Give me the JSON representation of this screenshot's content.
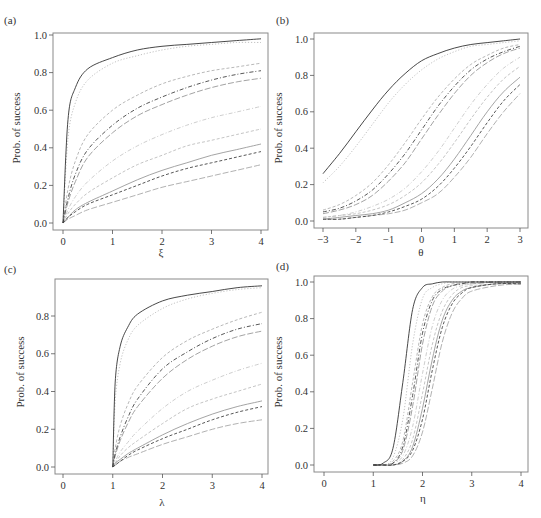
{
  "figure": {
    "panels": [
      {
        "label": "(a)",
        "xlabel": "ξ",
        "ylabel": "Prob. of success"
      },
      {
        "label": "(b)",
        "xlabel": "θ",
        "ylabel": "Prob. of success"
      },
      {
        "label": "(c)",
        "xlabel": "λ",
        "ylabel": "Prob. of success"
      },
      {
        "label": "(d)",
        "xlabel": "η",
        "ylabel": "Prob. of success"
      }
    ]
  },
  "chart_data": [
    {
      "type": "line",
      "panel": "(a)",
      "title": "",
      "xlabel": "ξ",
      "ylabel": "Prob. of success",
      "xlim": [
        0,
        4
      ],
      "ylim": [
        0.0,
        1.0
      ],
      "xticks": [
        "0",
        "1",
        "2",
        "3",
        "4"
      ],
      "yticks": [
        "0.0",
        "0.2",
        "0.4",
        "0.6",
        "0.8",
        "1.0"
      ],
      "grid": false,
      "legend": null,
      "x": [
        0,
        0.1,
        0.25,
        0.5,
        1,
        1.5,
        2,
        2.5,
        3,
        3.5,
        4
      ],
      "series": [
        {
          "name": "curve-1",
          "style": "solid",
          "color": "#333333",
          "values": [
            0,
            0.55,
            0.72,
            0.82,
            0.88,
            0.92,
            0.94,
            0.95,
            0.96,
            0.97,
            0.98
          ]
        },
        {
          "name": "curve-2",
          "style": "dotted",
          "color": "#bbbbbb",
          "values": [
            0,
            0.45,
            0.64,
            0.76,
            0.85,
            0.89,
            0.92,
            0.94,
            0.95,
            0.96,
            0.96
          ]
        },
        {
          "name": "curve-3",
          "style": "dashed",
          "color": "#b0b0b0",
          "values": [
            0,
            0.18,
            0.33,
            0.47,
            0.6,
            0.68,
            0.74,
            0.78,
            0.81,
            0.83,
            0.85
          ]
        },
        {
          "name": "curve-4",
          "style": "dashdot",
          "color": "#444444",
          "values": [
            0,
            0.13,
            0.26,
            0.39,
            0.52,
            0.61,
            0.67,
            0.72,
            0.76,
            0.79,
            0.81
          ]
        },
        {
          "name": "curve-5",
          "style": "longdash",
          "color": "#999999",
          "values": [
            0,
            0.11,
            0.22,
            0.35,
            0.48,
            0.57,
            0.63,
            0.68,
            0.72,
            0.75,
            0.77
          ]
        },
        {
          "name": "curve-6",
          "style": "dashdot",
          "color": "#c8c8c8",
          "values": [
            0,
            0.07,
            0.14,
            0.22,
            0.33,
            0.41,
            0.47,
            0.52,
            0.56,
            0.59,
            0.62
          ]
        },
        {
          "name": "curve-7",
          "style": "dashed",
          "color": "#bdbdbd",
          "values": [
            0,
            0.05,
            0.1,
            0.16,
            0.24,
            0.31,
            0.36,
            0.41,
            0.44,
            0.47,
            0.5
          ]
        },
        {
          "name": "curve-8",
          "style": "solid",
          "color": "#9a9a9a",
          "values": [
            0,
            0.03,
            0.07,
            0.11,
            0.17,
            0.23,
            0.28,
            0.32,
            0.36,
            0.39,
            0.42
          ]
        },
        {
          "name": "curve-9",
          "style": "dashed",
          "color": "#444444",
          "values": [
            0,
            0.03,
            0.06,
            0.1,
            0.15,
            0.2,
            0.25,
            0.29,
            0.32,
            0.35,
            0.38
          ]
        },
        {
          "name": "curve-10",
          "style": "longdash",
          "color": "#a8a8a8",
          "values": [
            0,
            0.02,
            0.04,
            0.07,
            0.11,
            0.15,
            0.19,
            0.22,
            0.25,
            0.28,
            0.31
          ]
        }
      ]
    },
    {
      "type": "line",
      "panel": "(b)",
      "title": "",
      "xlabel": "θ",
      "ylabel": "Prob. of success",
      "xlim": [
        -3,
        3
      ],
      "ylim": [
        0.0,
        1.0
      ],
      "xticks": [
        "−3",
        "−2",
        "−1",
        "0",
        "1",
        "2",
        "3"
      ],
      "yticks": [
        "0.0",
        "0.2",
        "0.4",
        "0.6",
        "0.8",
        "1.0"
      ],
      "grid": false,
      "legend": null,
      "x": [
        -3,
        -2.5,
        -2,
        -1.5,
        -1,
        -0.5,
        0,
        0.5,
        1,
        1.5,
        2,
        2.5,
        3
      ],
      "series": [
        {
          "name": "curve-1",
          "style": "solid",
          "color": "#333333",
          "values": [
            0.26,
            0.37,
            0.49,
            0.61,
            0.72,
            0.81,
            0.88,
            0.92,
            0.95,
            0.97,
            0.98,
            0.99,
            1.0
          ]
        },
        {
          "name": "curve-2",
          "style": "dotted",
          "color": "#bbbbbb",
          "values": [
            0.21,
            0.3,
            0.41,
            0.53,
            0.65,
            0.75,
            0.83,
            0.89,
            0.93,
            0.96,
            0.97,
            0.98,
            0.99
          ]
        },
        {
          "name": "curve-3",
          "style": "dashed",
          "color": "#b0b0b0",
          "values": [
            0.06,
            0.09,
            0.14,
            0.21,
            0.31,
            0.43,
            0.56,
            0.68,
            0.78,
            0.86,
            0.91,
            0.95,
            0.97
          ]
        },
        {
          "name": "curve-4",
          "style": "dashdot",
          "color": "#444444",
          "values": [
            0.05,
            0.07,
            0.11,
            0.17,
            0.26,
            0.37,
            0.5,
            0.63,
            0.74,
            0.83,
            0.89,
            0.93,
            0.96
          ]
        },
        {
          "name": "curve-5",
          "style": "longdash",
          "color": "#999999",
          "values": [
            0.04,
            0.06,
            0.09,
            0.14,
            0.22,
            0.32,
            0.45,
            0.58,
            0.7,
            0.8,
            0.87,
            0.92,
            0.95
          ]
        },
        {
          "name": "curve-6",
          "style": "dashdot",
          "color": "#c8c8c8",
          "values": [
            0.02,
            0.03,
            0.05,
            0.08,
            0.12,
            0.18,
            0.27,
            0.38,
            0.51,
            0.64,
            0.75,
            0.84,
            0.9
          ]
        },
        {
          "name": "curve-7",
          "style": "dashed",
          "color": "#bdbdbd",
          "values": [
            0.02,
            0.03,
            0.04,
            0.06,
            0.09,
            0.14,
            0.21,
            0.31,
            0.43,
            0.56,
            0.68,
            0.78,
            0.85
          ]
        },
        {
          "name": "curve-8",
          "style": "solid",
          "color": "#9a9a9a",
          "values": [
            0.01,
            0.02,
            0.03,
            0.04,
            0.06,
            0.1,
            0.15,
            0.23,
            0.34,
            0.47,
            0.6,
            0.71,
            0.79
          ]
        },
        {
          "name": "curve-9",
          "style": "dashed",
          "color": "#444444",
          "values": [
            0.01,
            0.01,
            0.02,
            0.03,
            0.05,
            0.08,
            0.12,
            0.19,
            0.29,
            0.41,
            0.54,
            0.66,
            0.75
          ]
        },
        {
          "name": "curve-10",
          "style": "longdash",
          "color": "#a8a8a8",
          "values": [
            0.01,
            0.01,
            0.02,
            0.03,
            0.04,
            0.06,
            0.1,
            0.15,
            0.24,
            0.35,
            0.48,
            0.6,
            0.7
          ]
        }
      ]
    },
    {
      "type": "line",
      "panel": "(c)",
      "title": "",
      "xlabel": "λ",
      "ylabel": "Prob. of success",
      "xlim": [
        0,
        4
      ],
      "ylim": [
        0.0,
        0.96
      ],
      "xticks": [
        "0",
        "1",
        "2",
        "3",
        "4"
      ],
      "yticks": [
        "0.0",
        "0.2",
        "0.4",
        "0.6",
        "0.8"
      ],
      "grid": false,
      "legend": null,
      "x": [
        1,
        1.05,
        1.15,
        1.3,
        1.5,
        2,
        2.5,
        3,
        3.5,
        4
      ],
      "series": [
        {
          "name": "curve-1",
          "style": "solid",
          "color": "#333333",
          "values": [
            0,
            0.45,
            0.64,
            0.74,
            0.81,
            0.88,
            0.91,
            0.93,
            0.95,
            0.96
          ]
        },
        {
          "name": "curve-2",
          "style": "dotted",
          "color": "#bbbbbb",
          "values": [
            0,
            0.35,
            0.55,
            0.67,
            0.75,
            0.84,
            0.89,
            0.92,
            0.94,
            0.95
          ]
        },
        {
          "name": "curve-3",
          "style": "dashed",
          "color": "#b0b0b0",
          "values": [
            0,
            0.1,
            0.22,
            0.33,
            0.43,
            0.58,
            0.67,
            0.73,
            0.78,
            0.82
          ]
        },
        {
          "name": "curve-4",
          "style": "dashdot",
          "color": "#444444",
          "values": [
            0,
            0.07,
            0.16,
            0.26,
            0.36,
            0.52,
            0.61,
            0.68,
            0.73,
            0.76
          ]
        },
        {
          "name": "curve-5",
          "style": "longdash",
          "color": "#999999",
          "values": [
            0,
            0.06,
            0.14,
            0.23,
            0.32,
            0.47,
            0.57,
            0.64,
            0.69,
            0.72
          ]
        },
        {
          "name": "curve-6",
          "style": "dashdot",
          "color": "#c8c8c8",
          "values": [
            0,
            0.03,
            0.08,
            0.13,
            0.19,
            0.31,
            0.4,
            0.46,
            0.51,
            0.55
          ]
        },
        {
          "name": "curve-7",
          "style": "dashed",
          "color": "#bdbdbd",
          "values": [
            0,
            0.02,
            0.06,
            0.1,
            0.14,
            0.23,
            0.31,
            0.36,
            0.4,
            0.44
          ]
        },
        {
          "name": "curve-8",
          "style": "solid",
          "color": "#9a9a9a",
          "values": [
            0,
            0.02,
            0.04,
            0.07,
            0.1,
            0.17,
            0.23,
            0.28,
            0.32,
            0.35
          ]
        },
        {
          "name": "curve-9",
          "style": "dashed",
          "color": "#444444",
          "values": [
            0,
            0.01,
            0.03,
            0.06,
            0.09,
            0.15,
            0.2,
            0.25,
            0.29,
            0.32
          ]
        },
        {
          "name": "curve-10",
          "style": "longdash",
          "color": "#a8a8a8",
          "values": [
            0,
            0.01,
            0.03,
            0.05,
            0.07,
            0.12,
            0.16,
            0.2,
            0.23,
            0.25
          ]
        }
      ]
    },
    {
      "type": "line",
      "panel": "(d)",
      "title": "",
      "xlabel": "η",
      "ylabel": "Prob. of success",
      "xlim": [
        0,
        4
      ],
      "ylim": [
        0.0,
        1.0
      ],
      "xticks": [
        "0",
        "1",
        "2",
        "3",
        "4"
      ],
      "yticks": [
        "0.0",
        "0.2",
        "0.4",
        "0.6",
        "0.8",
        "1.0"
      ],
      "grid": false,
      "legend": null,
      "x": [
        1.0,
        1.2,
        1.4,
        1.6,
        1.8,
        2.0,
        2.2,
        2.4,
        2.6,
        2.8,
        3.0,
        3.5,
        4.0
      ],
      "series": [
        {
          "name": "curve-1",
          "style": "solid",
          "color": "#333333",
          "values": [
            0.0,
            0.01,
            0.09,
            0.45,
            0.85,
            0.97,
            0.99,
            1.0,
            1.0,
            1.0,
            1.0,
            1.0,
            1.0
          ]
        },
        {
          "name": "curve-2",
          "style": "dotted",
          "color": "#bbbbbb",
          "values": [
            0.0,
            0.0,
            0.04,
            0.25,
            0.66,
            0.91,
            0.97,
            0.99,
            1.0,
            1.0,
            1.0,
            1.0,
            1.0
          ]
        },
        {
          "name": "curve-3",
          "style": "dashed",
          "color": "#b0b0b0",
          "values": [
            0.0,
            0.0,
            0.02,
            0.13,
            0.45,
            0.77,
            0.92,
            0.97,
            0.99,
            0.99,
            1.0,
            1.0,
            1.0
          ]
        },
        {
          "name": "curve-4",
          "style": "dashdot",
          "color": "#444444",
          "values": [
            0.0,
            0.0,
            0.01,
            0.1,
            0.38,
            0.72,
            0.9,
            0.96,
            0.98,
            0.99,
            1.0,
            1.0,
            1.0
          ]
        },
        {
          "name": "curve-5",
          "style": "longdash",
          "color": "#999999",
          "values": [
            0.0,
            0.0,
            0.01,
            0.08,
            0.32,
            0.66,
            0.87,
            0.95,
            0.98,
            0.99,
            0.99,
            1.0,
            1.0
          ]
        },
        {
          "name": "curve-6",
          "style": "dashdot",
          "color": "#c8c8c8",
          "values": [
            0.0,
            0.0,
            0.01,
            0.05,
            0.21,
            0.5,
            0.76,
            0.9,
            0.96,
            0.98,
            0.99,
            1.0,
            1.0
          ]
        },
        {
          "name": "curve-7",
          "style": "dashed",
          "color": "#bdbdbd",
          "values": [
            0.0,
            0.0,
            0.0,
            0.03,
            0.14,
            0.39,
            0.66,
            0.84,
            0.93,
            0.97,
            0.98,
            0.99,
            1.0
          ]
        },
        {
          "name": "curve-8",
          "style": "solid",
          "color": "#9a9a9a",
          "values": [
            0.0,
            0.0,
            0.0,
            0.02,
            0.1,
            0.31,
            0.58,
            0.79,
            0.9,
            0.95,
            0.97,
            0.99,
            0.99
          ]
        },
        {
          "name": "curve-9",
          "style": "dashed",
          "color": "#444444",
          "values": [
            0.0,
            0.0,
            0.0,
            0.02,
            0.08,
            0.25,
            0.52,
            0.75,
            0.88,
            0.94,
            0.97,
            0.99,
            0.99
          ]
        },
        {
          "name": "curve-10",
          "style": "longdash",
          "color": "#a8a8a8",
          "values": [
            0.0,
            0.0,
            0.0,
            0.01,
            0.05,
            0.18,
            0.42,
            0.67,
            0.83,
            0.91,
            0.95,
            0.98,
            0.99
          ]
        }
      ]
    }
  ],
  "layout": {
    "panels": [
      {
        "box": [
          53,
          33,
          268,
          230
        ],
        "px_x": [
          63,
          261
        ],
        "px_y": [
          223,
          35
        ],
        "label_pos": [
          4,
          24
        ],
        "xlabel_pos": [
          161,
          256
        ],
        "ylabel_pos": [
          20,
          128
        ]
      },
      {
        "box": [
          314,
          33,
          528,
          228
        ],
        "px_x": [
          323,
          520
        ],
        "px_y": [
          221,
          39
        ],
        "label_pos": [
          276,
          24
        ],
        "xlabel_pos": [
          421,
          256
        ],
        "ylabel_pos": [
          282,
          128
        ]
      },
      {
        "box": [
          55,
          279,
          268,
          474
        ],
        "px_x": [
          63,
          262
        ],
        "px_y": [
          467,
          278
        ],
        "label_pos": [
          4,
          273
        ],
        "xlabel_pos": [
          162,
          506
        ],
        "ylabel_pos": [
          24,
          372
        ]
      },
      {
        "box": [
          314,
          276,
          528,
          472
        ],
        "px_x": [
          324,
          521
        ],
        "px_y": [
          465,
          282
        ],
        "label_pos": [
          276,
          270
        ],
        "xlabel_pos": [
          423,
          502
        ],
        "ylabel_pos": [
          282,
          372
        ]
      }
    ]
  }
}
